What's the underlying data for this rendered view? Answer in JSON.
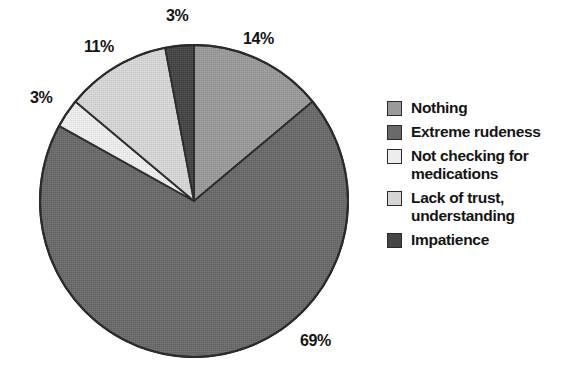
{
  "chart_data": {
    "type": "pie",
    "title": "",
    "subtitle": "",
    "xlabel": "",
    "ylabel": "",
    "grid": false,
    "legend_position": "right",
    "start_angle_deg": 0,
    "direction": "clockwise",
    "units": "percent",
    "categories": [
      "Nothing",
      "Extreme rudeness",
      "Not checking for medications",
      "Lack of trust, understanding",
      "Impatience"
    ],
    "values": [
      14,
      69,
      3,
      11,
      3
    ],
    "data_labels": [
      "14%",
      "69%",
      "3%",
      "11%",
      "3%"
    ],
    "colors": [
      "#9a9a9a",
      "#6a6a6a",
      "#ededed",
      "#d6d6d6",
      "#464646"
    ],
    "slices": [
      {
        "label": "Nothing",
        "value": 14,
        "data_label": "14%",
        "color": "#9a9a9a",
        "start_angle_deg": 0,
        "end_angle_deg": 50.4
      },
      {
        "label": "Extreme rudeness",
        "value": 69,
        "data_label": "69%",
        "color": "#6a6a6a",
        "start_angle_deg": 50.4,
        "end_angle_deg": 298.8
      },
      {
        "label": "Not checking for medications",
        "value": 3,
        "data_label": "3%",
        "color": "#ededed",
        "start_angle_deg": 298.8,
        "end_angle_deg": 309.6
      },
      {
        "label": "Lack of trust, understanding",
        "value": 11,
        "data_label": "11%",
        "color": "#d6d6d6",
        "start_angle_deg": 309.6,
        "end_angle_deg": 349.2
      },
      {
        "label": "Impatience",
        "value": 3,
        "data_label": "3%",
        "color": "#464646",
        "start_angle_deg": 349.2,
        "end_angle_deg": 360
      }
    ]
  },
  "labels": {
    "nothing_pct": "14%",
    "extreme_pct": "69%",
    "notchecking_pct": "3%",
    "lackoftrust_pct": "11%",
    "impatience_pct": "3%"
  },
  "legend": {
    "items": [
      {
        "label": "Nothing",
        "color": "#9a9a9a"
      },
      {
        "label": "Extreme rudeness",
        "color": "#6a6a6a"
      },
      {
        "label": "Not checking for medications",
        "color": "#ededed"
      },
      {
        "label": "Lack of trust, understanding",
        "color": "#d6d6d6"
      },
      {
        "label": "Impatience",
        "color": "#464646"
      }
    ]
  },
  "colors": {
    "background": "#ffffff",
    "outline": "#2b2b2b",
    "text": "#141414"
  }
}
